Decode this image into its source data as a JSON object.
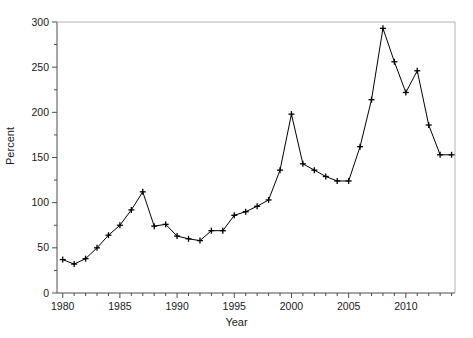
{
  "chart_data": {
    "type": "line",
    "title": "",
    "xlabel": "Year",
    "ylabel": "Percent",
    "xlim": [
      1979.5,
      2014.3
    ],
    "ylim": [
      0,
      300
    ],
    "xticks_major": [
      1980,
      1985,
      1990,
      1995,
      2000,
      2005,
      2010
    ],
    "xtick_labels": [
      "1980",
      "1985",
      "1990",
      "1995",
      "2000",
      "2005",
      "2010"
    ],
    "xticks_minor_step": 1,
    "yticks_major": [
      0,
      50,
      100,
      150,
      200,
      250,
      300
    ],
    "ytick_labels": [
      "0",
      "50",
      "100",
      "150",
      "200",
      "250",
      "300"
    ],
    "yticks_minor": [
      25,
      75,
      125,
      175,
      225,
      275
    ],
    "grid": false,
    "legend": null,
    "marker": "plus",
    "line_color": "#000000",
    "marker_color": "#000000",
    "x": [
      1980,
      1981,
      1982,
      1983,
      1984,
      1985,
      1986,
      1987,
      1988,
      1989,
      1990,
      1991,
      1992,
      1993,
      1994,
      1995,
      1996,
      1997,
      1998,
      1999,
      2000,
      2001,
      2002,
      2003,
      2004,
      2005,
      2006,
      2007,
      2008,
      2009,
      2010,
      2011,
      2012,
      2013,
      2014
    ],
    "values": [
      37,
      32,
      38,
      50,
      64,
      75,
      92,
      112,
      74,
      76,
      63,
      60,
      58,
      69,
      69,
      86,
      90,
      96,
      103,
      136,
      198,
      143,
      136,
      129,
      124,
      124,
      162,
      214,
      293,
      256,
      222,
      246,
      186,
      153,
      153
    ],
    "series": [
      {
        "name": "Percent",
        "values": [
          37,
          32,
          38,
          50,
          64,
          75,
          92,
          112,
          74,
          76,
          63,
          60,
          58,
          69,
          69,
          86,
          90,
          96,
          103,
          136,
          198,
          143,
          136,
          129,
          124,
          124,
          162,
          214,
          293,
          256,
          222,
          246,
          186,
          153,
          153
        ]
      }
    ],
    "annotations": []
  },
  "axes": {
    "ylabel_text": "Percent",
    "xlabel_text": "Year"
  }
}
